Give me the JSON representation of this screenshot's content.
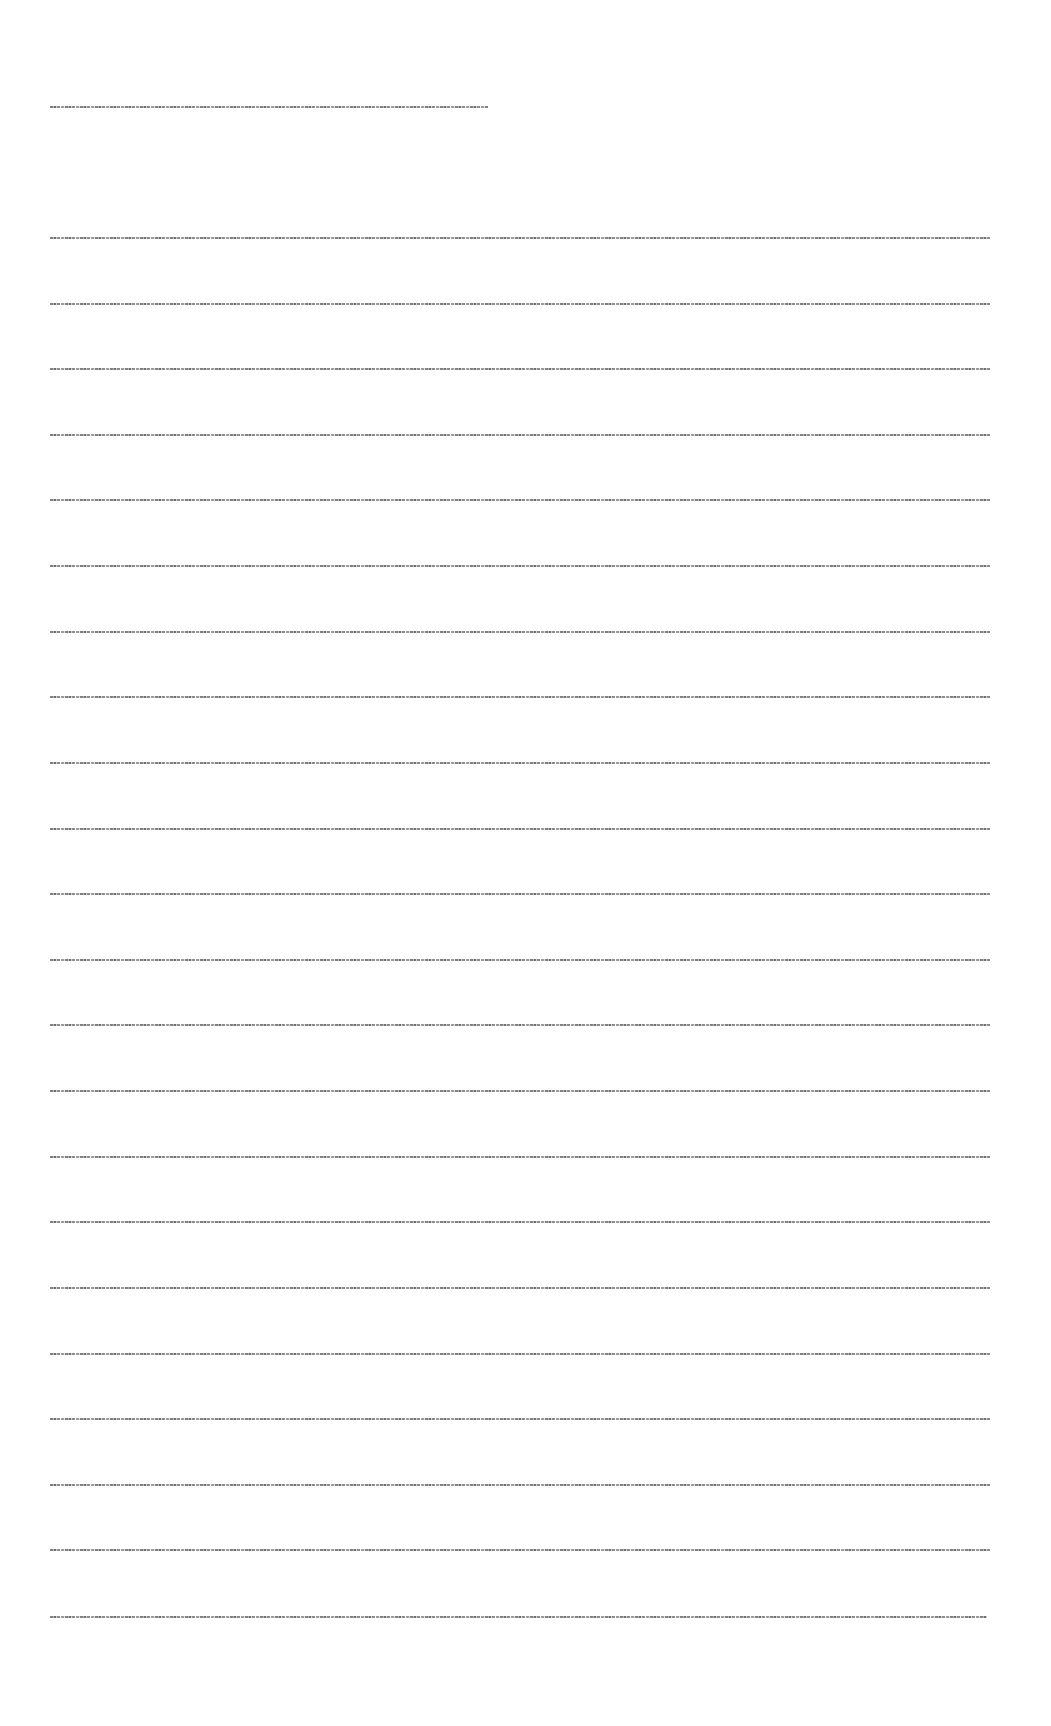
{
  "document": {
    "heading": {
      "text": "[illegible heading text]",
      "top": 106,
      "width": 438
    },
    "body_lines": [
      {
        "text": "[illegible line 1]",
        "top": 237,
        "width": 940
      },
      {
        "text": "[illegible line 2]",
        "top": 303,
        "width": 940
      },
      {
        "text": "[illegible line 3]",
        "top": 368,
        "width": 940
      },
      {
        "text": "[illegible line 4]",
        "top": 434,
        "width": 940
      },
      {
        "text": "[illegible line 5]",
        "top": 499,
        "width": 940
      },
      {
        "text": "[illegible line 6]",
        "top": 565,
        "width": 940
      },
      {
        "text": "[illegible line 7]",
        "top": 631,
        "width": 940
      },
      {
        "text": "[illegible line 8]",
        "top": 696,
        "width": 940
      },
      {
        "text": "[illegible line 9]",
        "top": 762,
        "width": 940
      },
      {
        "text": "[illegible line 10]",
        "top": 828,
        "width": 940
      },
      {
        "text": "[illegible line 11]",
        "top": 893,
        "width": 940
      },
      {
        "text": "[illegible line 12]",
        "top": 959,
        "width": 940
      },
      {
        "text": "[illegible line 13]",
        "top": 1024,
        "width": 940
      },
      {
        "text": "[illegible line 14]",
        "top": 1090,
        "width": 940
      },
      {
        "text": "[illegible line 15]",
        "top": 1156,
        "width": 940
      },
      {
        "text": "[illegible line 16]",
        "top": 1221,
        "width": 940
      },
      {
        "text": "[illegible line 17]",
        "top": 1287,
        "width": 940
      },
      {
        "text": "[illegible line 18]",
        "top": 1353,
        "width": 940
      },
      {
        "text": "[illegible line 19]",
        "top": 1418,
        "width": 940
      },
      {
        "text": "[illegible line 20]",
        "top": 1484,
        "width": 940
      },
      {
        "text": "[illegible line 21]",
        "top": 1549,
        "width": 940
      },
      {
        "text": "[illegible line 22]",
        "top": 1616,
        "width": 937
      }
    ]
  }
}
